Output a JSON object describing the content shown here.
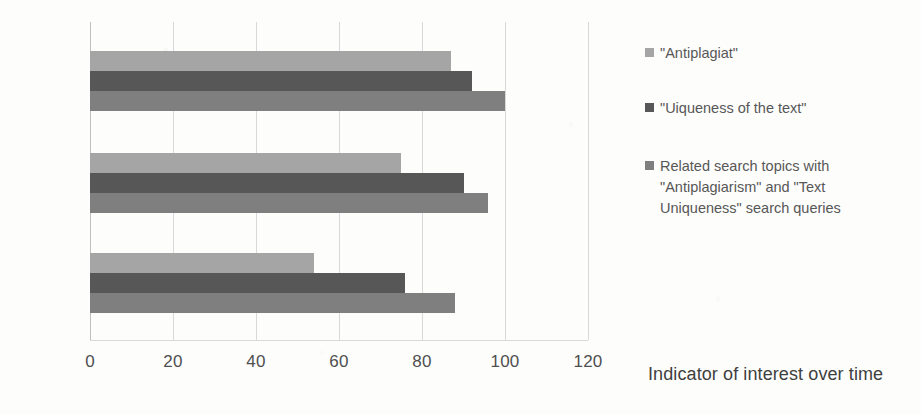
{
  "chart_data": {
    "type": "bar",
    "orientation": "horizontal",
    "title": "",
    "xlabel": "Indicator of interest over time",
    "ylabel": "",
    "categories": [
      "2021",
      "2020",
      "2019"
    ],
    "xlim": [
      0,
      120
    ],
    "xticks": [
      0,
      20,
      40,
      60,
      80,
      100,
      120
    ],
    "xtick_labels": [
      "0",
      "20",
      "40",
      "60",
      "80",
      "100",
      "120"
    ],
    "grid": true,
    "legend_position": "right",
    "series": [
      {
        "name": "\"Antiplagiat\"",
        "color": "#a5a5a5",
        "values": [
          87,
          75,
          54
        ]
      },
      {
        "name": "\"Uiqueness of the text\"",
        "color": "#575757",
        "values": [
          92,
          90,
          76
        ]
      },
      {
        "name": "Related search topics with \"Antiplagiarism\" and \"Text Uniqueness\" search queries",
        "color": "#7f7f7f",
        "values": [
          100,
          96,
          88
        ]
      }
    ]
  },
  "legend": {
    "items": [
      {
        "label": "\"Antiplagiat\"",
        "color": "#a5a5a5"
      },
      {
        "label": "\"Uiqueness of the text\"",
        "color": "#575757"
      },
      {
        "label": "Related search topics with\n\"Antiplagiarism\" and \"Text\nUniqueness\" search queries",
        "color": "#7f7f7f"
      }
    ]
  },
  "axis_title": "Indicator of interest over time",
  "colors": {
    "background": "#fdfdfc",
    "gridline": "#d9d9d9",
    "text": "#4f4f4f",
    "series_light": "#a5a5a5",
    "series_dark": "#575757",
    "series_medium": "#7f7f7f"
  }
}
